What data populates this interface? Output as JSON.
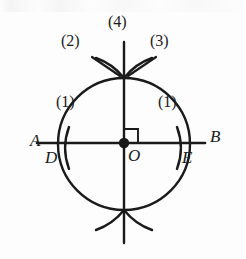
{
  "figure": {
    "background_color": "#fdfdfd",
    "ink_color": "#1a1a1a",
    "points": [
      {
        "id": "A",
        "label": "A",
        "x": 30,
        "y": 141,
        "kind": "line-endpoint-label"
      },
      {
        "id": "B",
        "label": "B",
        "x": 212,
        "y": 137,
        "kind": "line-endpoint-label"
      },
      {
        "id": "D",
        "label": "D",
        "x": 46,
        "y": 160,
        "kind": "arc-intersection-label"
      },
      {
        "id": "E",
        "label": "E",
        "x": 183,
        "y": 160,
        "kind": "arc-intersection-label"
      },
      {
        "id": "O",
        "label": "O",
        "x": 128,
        "y": 158,
        "kind": "center-label"
      }
    ],
    "step_labels": [
      {
        "id": "step-1-left",
        "label": "(1)",
        "x": 59,
        "y": 102
      },
      {
        "id": "step-2",
        "label": "(2)",
        "x": 63,
        "y": 40
      },
      {
        "id": "step-3",
        "label": "(3)",
        "x": 152,
        "y": 40
      },
      {
        "id": "step-4",
        "label": "(4)",
        "x": 110,
        "y": 12
      },
      {
        "id": "step-1-right",
        "label": "(1)",
        "x": 160,
        "y": 102
      }
    ],
    "line_ab": {
      "x1": 37,
      "y1": 143,
      "x2": 205,
      "y2": 143,
      "label": "AB"
    },
    "line_vertical": {
      "x1": 124,
      "y1": 42,
      "x2": 124,
      "y2": 243,
      "label": "perpendicular"
    },
    "center_dot": {
      "cx": 124,
      "cy": 143,
      "r": 5
    },
    "right_angle_mark": {
      "x": 124,
      "y": 143,
      "size": 14,
      "quadrant": "upper-right"
    },
    "marks": {
      "tick_d": {
        "cx": 66,
        "cy": 148,
        "opens": "right"
      },
      "tick_e": {
        "cx": 180,
        "cy": 148,
        "opens": "left"
      },
      "lens_top": {
        "x": 124,
        "y": 78
      },
      "lens_bottom": {
        "x": 124,
        "y": 210
      }
    },
    "colors": {
      "ink": "#1a1a1a",
      "paper": "#fdfdfd"
    }
  }
}
